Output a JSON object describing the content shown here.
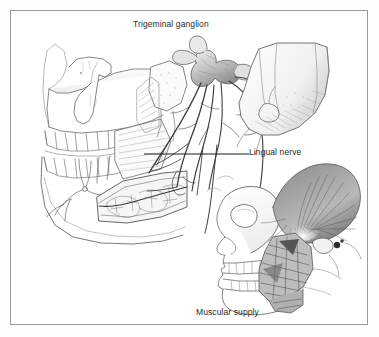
{
  "figure": {
    "type": "anatomical-illustration",
    "background_color": "#ffffff",
    "border_color": "#9a9a9a",
    "ink_color": "#3a3a3a",
    "labels": {
      "trigeminal_ganglion": "Trigeminal ganglion",
      "lingual_nerve": "Lingual nerve",
      "muscular_supply": "Muscular supply"
    },
    "leader_line": {
      "name": "lingual-nerve-leader",
      "color": "#1c1c1c"
    },
    "panels": [
      {
        "name": "main-skull-panel",
        "description": "Lateral skull with mandible, opened mandibular canal and trigeminal nerve branches"
      },
      {
        "name": "muscular-supply-inset",
        "description": "Smaller lateral skull showing temporalis and masseter muscular supply"
      }
    ]
  }
}
